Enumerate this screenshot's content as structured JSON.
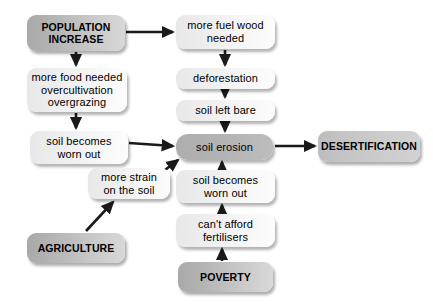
{
  "diagram": {
    "type": "flowchart",
    "width": 433,
    "height": 306,
    "background": "#ffffff",
    "colors": {
      "light_box": "#eeeeee",
      "strong_box": "#bdbdbd",
      "hub_box": "#b4b4b4",
      "outcome_box": "#c8c8c8",
      "text": "#000000",
      "arrow": "#1a1a1a"
    },
    "nodes": [
      {
        "id": "population-increase",
        "label": "POPULATION\nINCREASE",
        "style": "strong",
        "x": 27,
        "y": 15,
        "w": 98,
        "h": 36
      },
      {
        "id": "more-fuel-wood-needed",
        "label": "more fuel wood\nneeded",
        "style": "light",
        "x": 176,
        "y": 15,
        "w": 99,
        "h": 34
      },
      {
        "id": "more-food-needed",
        "label": "more food needed\novercultivation\novergrazing",
        "style": "light",
        "x": 27,
        "y": 68,
        "w": 100,
        "h": 44
      },
      {
        "id": "deforestation",
        "label": "deforestation",
        "style": "light",
        "x": 176,
        "y": 68,
        "w": 99,
        "h": 21
      },
      {
        "id": "soil-left-bare",
        "label": "soil left bare",
        "style": "light",
        "x": 176,
        "y": 100,
        "w": 99,
        "h": 21
      },
      {
        "id": "soil-becomes-worn-out-left",
        "label": "soil becomes\nworn out",
        "style": "light",
        "x": 30,
        "y": 131,
        "w": 98,
        "h": 33
      },
      {
        "id": "soil-erosion",
        "label": "soil erosion",
        "style": "hub",
        "x": 176,
        "y": 134,
        "w": 97,
        "h": 26
      },
      {
        "id": "desertification",
        "label": "DESERTIFICATION",
        "style": "outcome",
        "x": 318,
        "y": 131,
        "w": 102,
        "h": 31
      },
      {
        "id": "more-strain-on-the-soil",
        "label": "more strain\non the soil",
        "style": "light",
        "x": 88,
        "y": 168,
        "w": 82,
        "h": 31
      },
      {
        "id": "soil-becomes-worn-out-right",
        "label": "soil becomes\nworn out",
        "style": "light",
        "x": 176,
        "y": 170,
        "w": 99,
        "h": 33
      },
      {
        "id": "cant-afford-fertilisers",
        "label": "can't afford\nfertilisers",
        "style": "light",
        "x": 176,
        "y": 214,
        "w": 99,
        "h": 33
      },
      {
        "id": "agriculture",
        "label": "AGRICULTURE",
        "style": "strong",
        "x": 27,
        "y": 233,
        "w": 98,
        "h": 30
      },
      {
        "id": "poverty",
        "label": "POVERTY",
        "style": "strong",
        "x": 178,
        "y": 262,
        "w": 95,
        "h": 30
      }
    ],
    "edges": [
      {
        "id": "edge-population-to-fuelwood",
        "from": "population-increase",
        "to": "more-fuel-wood-needed",
        "kind": "horizontal"
      },
      {
        "id": "edge-population-to-food",
        "from": "population-increase",
        "to": "more-food-needed",
        "kind": "vertical"
      },
      {
        "id": "edge-fuelwood-to-deforestation",
        "from": "more-fuel-wood-needed",
        "to": "deforestation",
        "kind": "vertical"
      },
      {
        "id": "edge-deforestation-to-bare",
        "from": "deforestation",
        "to": "soil-left-bare",
        "kind": "vertical"
      },
      {
        "id": "edge-bare-to-erosion",
        "from": "soil-left-bare",
        "to": "soil-erosion",
        "kind": "vertical"
      },
      {
        "id": "edge-food-to-wornout",
        "from": "more-food-needed",
        "to": "soil-becomes-worn-out-left",
        "kind": "vertical"
      },
      {
        "id": "edge-wornoutleft-to-erosion",
        "from": "soil-becomes-worn-out-left",
        "to": "soil-erosion",
        "kind": "horizontal"
      },
      {
        "id": "edge-strain-to-erosion",
        "from": "more-strain-on-the-soil",
        "to": "soil-erosion",
        "kind": "diagonal"
      },
      {
        "id": "edge-agriculture-to-strain",
        "from": "agriculture",
        "to": "more-strain-on-the-soil",
        "kind": "diagonal"
      },
      {
        "id": "edge-wornoutright-to-erosion",
        "from": "soil-becomes-worn-out-right",
        "to": "soil-erosion",
        "kind": "vertical"
      },
      {
        "id": "edge-fertilisers-to-wornout",
        "from": "can't-afford-fertilisers",
        "to": "soil-becomes-worn-out-right",
        "kind": "vertical"
      },
      {
        "id": "edge-poverty-to-fertilisers",
        "from": "poverty",
        "to": "can't-afford-fertilisers",
        "kind": "vertical"
      },
      {
        "id": "edge-erosion-to-desertification",
        "from": "soil-erosion",
        "to": "desertification",
        "kind": "horizontal"
      }
    ]
  }
}
